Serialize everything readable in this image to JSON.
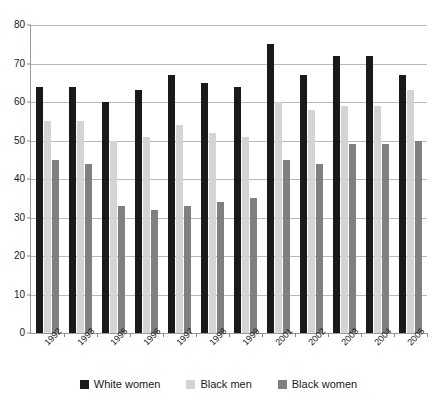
{
  "chart_data": {
    "type": "bar",
    "title": "",
    "subtitle": "",
    "xlabel": "",
    "ylabel": "",
    "ylim": [
      0,
      80
    ],
    "yticks": [
      0,
      10,
      20,
      30,
      40,
      50,
      60,
      70,
      80
    ],
    "grid": true,
    "legend_position": "bottom",
    "categories": [
      "1992",
      "1993",
      "1995",
      "1996",
      "1997",
      "1998",
      "1999",
      "2001",
      "2002",
      "2003",
      "2004",
      "2005"
    ],
    "series": [
      {
        "name": "White women",
        "color": "#1a1a1a",
        "values": [
          64,
          64,
          60,
          63,
          67,
          65,
          64,
          75,
          67,
          72,
          72,
          67
        ]
      },
      {
        "name": "Black men",
        "color": "#d4d4d4",
        "values": [
          55,
          55,
          50,
          51,
          54,
          52,
          51,
          60,
          58,
          59,
          59,
          63
        ]
      },
      {
        "name": "Black women",
        "color": "#808080",
        "values": [
          45,
          44,
          33,
          32,
          33,
          34,
          35,
          45,
          44,
          49,
          49,
          50
        ]
      }
    ]
  },
  "axes": {
    "grid_color": "#b9b9b9",
    "axis_color": "#9a9a9a"
  }
}
